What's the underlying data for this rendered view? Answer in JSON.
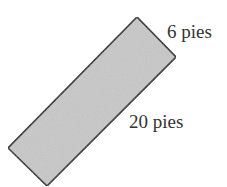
{
  "diagram": {
    "shape": "rectangle",
    "fill_color": "#c8c8c8",
    "stroke_color": "#222222",
    "corners": [
      [
        137,
        17
      ],
      [
        176,
        57
      ],
      [
        47,
        186
      ],
      [
        8,
        148
      ]
    ],
    "labels": {
      "width": "6 pies",
      "length": "20 pies"
    }
  }
}
